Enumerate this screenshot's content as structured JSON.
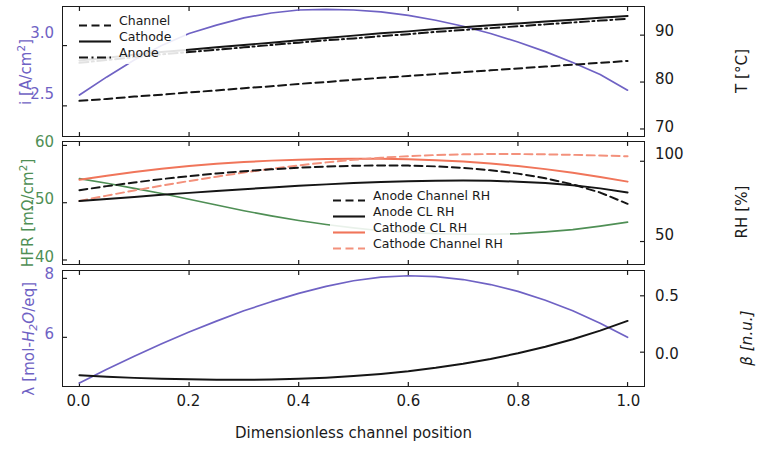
{
  "figure": {
    "xlabel": "Dimensionless channel position",
    "xticks": [
      "0.0",
      "0.2",
      "0.4",
      "0.6",
      "0.8",
      "1.0"
    ],
    "xlim": [
      -0.03,
      1.03
    ],
    "colors": {
      "purple": "#6f62c4",
      "green": "#4f8f55",
      "black": "#151515",
      "salmon": "#f0755a",
      "salmon_light": "#f3917c",
      "axis": "#1a1a1a"
    }
  },
  "panel_top": {
    "left_axis_label": "i [A/cm",
    "left_axis_label_sup": "2",
    "left_axis_label_end": "]",
    "left_ticks": [
      "3.0",
      "2.5"
    ],
    "right_axis_label": "T [°C]",
    "right_ticks": [
      "90",
      "80",
      "70"
    ],
    "legend": [
      {
        "label": "Channel",
        "style": "dashed",
        "color": "#151515"
      },
      {
        "label": "Cathode",
        "style": "solid",
        "color": "#151515"
      },
      {
        "label": "Anode",
        "style": "dashdot",
        "color": "#151515"
      }
    ]
  },
  "panel_mid": {
    "left_axis_label": "HFR [mΩ/cm",
    "left_axis_label_sup": "2",
    "left_axis_label_end": "]",
    "left_ticks": [
      "60",
      "50",
      "40"
    ],
    "right_axis_label": "RH [%]",
    "right_ticks": [
      "100",
      "50"
    ],
    "legend": [
      {
        "label": "Anode Channel RH",
        "style": "dashed",
        "color": "#151515"
      },
      {
        "label": "Anode CL RH",
        "style": "solid",
        "color": "#151515"
      },
      {
        "label": "Cathode CL RH",
        "style": "solid",
        "color": "#f0755a"
      },
      {
        "label": "Cathode Channel RH",
        "style": "dashed",
        "color": "#f3917c"
      }
    ]
  },
  "panel_bot": {
    "left_axis_label_pre": "λ [mol-",
    "left_axis_label_ital": "H",
    "left_axis_label_sub": "2",
    "left_axis_label_ital2": "O",
    "left_axis_label_post": "/eq]",
    "left_ticks": [
      "8",
      "6"
    ],
    "right_axis_label": "β [n.u.]",
    "right_ticks": [
      "0.5",
      "0.0"
    ]
  },
  "chart_data": [
    {
      "type": "line",
      "panel": "top",
      "title": "",
      "xlabel": "",
      "x": [
        0,
        0.05,
        0.1,
        0.15,
        0.2,
        0.25,
        0.3,
        0.35,
        0.4,
        0.45,
        0.5,
        0.55,
        0.6,
        0.65,
        0.7,
        0.75,
        0.8,
        0.85,
        0.9,
        0.95,
        1.0
      ],
      "left": {
        "ylabel": "i [A/cm2]",
        "ylim": [
          2.25,
          3.32
        ],
        "yticks": [
          2.5,
          3.0
        ],
        "grid": false,
        "series": [
          {
            "name": "Current density",
            "color": "#6f62c4",
            "style": "solid",
            "values": [
              2.59,
              2.74,
              2.88,
              3.0,
              3.1,
              3.17,
              3.23,
              3.27,
              3.295,
              3.3,
              3.295,
              3.28,
              3.25,
              3.21,
              3.16,
              3.1,
              3.03,
              2.95,
              2.86,
              2.76,
              2.63
            ]
          }
        ]
      },
      "right": {
        "ylabel": "T [°C]",
        "ylim": [
          68.5,
          96.0
        ],
        "yticks": [
          70,
          80,
          90
        ],
        "grid": false,
        "series": [
          {
            "name": "Cathode",
            "color": "#151515",
            "style": "solid",
            "values": [
              84.6,
              85.2,
              85.8,
              86.4,
              86.9,
              87.4,
              87.9,
              88.4,
              88.9,
              89.4,
              89.9,
              90.4,
              90.8,
              91.3,
              91.7,
              92.1,
              92.5,
              92.9,
              93.3,
              93.7,
              94.1
            ]
          },
          {
            "name": "Anode",
            "color": "#151515",
            "style": "dashdot",
            "values": [
              84.1,
              84.7,
              85.3,
              85.9,
              86.4,
              86.9,
              87.4,
              87.9,
              88.4,
              88.9,
              89.3,
              89.8,
              90.2,
              90.7,
              91.1,
              91.5,
              91.9,
              92.3,
              92.7,
              93.1,
              93.5
            ]
          },
          {
            "name": "Channel",
            "color": "#151515",
            "style": "dashed",
            "values": [
              76.0,
              76.4,
              76.9,
              77.3,
              77.8,
              78.2,
              78.7,
              79.1,
              79.6,
              80.0,
              80.5,
              80.9,
              81.3,
              81.7,
              82.1,
              82.5,
              82.9,
              83.3,
              83.7,
              84.1,
              84.5
            ]
          }
        ]
      }
    },
    {
      "type": "line",
      "panel": "middle",
      "x": [
        0,
        0.05,
        0.1,
        0.15,
        0.2,
        0.25,
        0.3,
        0.35,
        0.4,
        0.45,
        0.5,
        0.55,
        0.6,
        0.65,
        0.7,
        0.75,
        0.8,
        0.85,
        0.9,
        0.95,
        1.0
      ],
      "left": {
        "ylabel": "HFR [mOhm/cm2]",
        "ylim": [
          39.3,
          60.6
        ],
        "yticks": [
          40,
          50,
          60
        ],
        "grid": false,
        "series": [
          {
            "name": "HFR",
            "color": "#4f8f55",
            "style": "solid",
            "values": [
              54.2,
              53.4,
              52.5,
              51.6,
              50.6,
              49.6,
              48.6,
              47.7,
              46.9,
              46.2,
              45.6,
              45.1,
              44.8,
              44.6,
              44.5,
              44.5,
              44.6,
              44.9,
              45.3,
              45.9,
              46.6
            ]
          }
        ]
      },
      "right": {
        "ylabel": "RH [%]",
        "ylim": [
          36.0,
          112.0
        ],
        "yticks": [
          50,
          100
        ],
        "grid": false,
        "series": [
          {
            "name": "Cathode CL RH",
            "color": "#f0755a",
            "style": "solid",
            "values": [
              88.5,
              91.0,
              93.3,
              95.3,
              97.0,
              98.4,
              99.5,
              100.4,
              101.0,
              101.4,
              101.6,
              101.6,
              101.3,
              100.7,
              99.8,
              98.6,
              97.0,
              95.1,
              92.8,
              90.2,
              87.3
            ]
          },
          {
            "name": "Cathode Channel RH",
            "color": "#f3917c",
            "style": "dashed",
            "values": [
              75.3,
              78.6,
              81.8,
              84.8,
              87.7,
              90.4,
              93.0,
              95.3,
              97.4,
              99.3,
              100.9,
              102.2,
              103.2,
              103.9,
              104.3,
              104.5,
              104.5,
              104.3,
              104.0,
              103.6,
              103.1
            ]
          },
          {
            "name": "Anode Channel RH",
            "color": "#151515",
            "style": "dashed",
            "values": [
              82.0,
              84.5,
              86.8,
              88.9,
              90.7,
              92.4,
              93.8,
              95.0,
              96.0,
              96.7,
              97.2,
              97.4,
              97.3,
              96.8,
              95.9,
              94.4,
              92.3,
              89.4,
              85.6,
              80.5,
              73.5
            ]
          },
          {
            "name": "Anode CL RH",
            "color": "#151515",
            "style": "solid",
            "values": [
              75.2,
              76.5,
              77.8,
              79.1,
              80.3,
              81.5,
              82.6,
              83.7,
              84.7,
              85.6,
              86.4,
              87.1,
              87.6,
              87.9,
              88.0,
              87.8,
              87.3,
              86.4,
              85.0,
              83.1,
              80.6
            ]
          }
        ]
      }
    },
    {
      "type": "line",
      "panel": "bottom",
      "x": [
        0,
        0.05,
        0.1,
        0.15,
        0.2,
        0.25,
        0.3,
        0.35,
        0.4,
        0.45,
        0.5,
        0.55,
        0.6,
        0.65,
        0.7,
        0.75,
        0.8,
        0.85,
        0.9,
        0.95,
        1.0
      ],
      "left": {
        "ylabel": "lambda [mol-H2O/eq]",
        "ylim": [
          4.35,
          8.25
        ],
        "yticks": [
          6,
          8
        ],
        "grid": false,
        "series": [
          {
            "name": "Water content lambda",
            "color": "#6f62c4",
            "style": "solid",
            "values": [
              4.45,
              4.92,
              5.36,
              5.78,
              6.18,
              6.55,
              6.9,
              7.21,
              7.49,
              7.73,
              7.92,
              8.04,
              8.09,
              8.06,
              7.96,
              7.79,
              7.56,
              7.26,
              6.9,
              6.48,
              6.0
            ]
          }
        ]
      },
      "right": {
        "ylabel": "beta [n.u.]",
        "ylim": [
          -0.3,
          0.72
        ],
        "yticks": [
          0.0,
          0.5
        ],
        "grid": false,
        "series": [
          {
            "name": "Water transport coefficient beta",
            "color": "#151515",
            "style": "solid",
            "values": [
              -0.205,
              -0.218,
              -0.228,
              -0.236,
              -0.241,
              -0.244,
              -0.245,
              -0.242,
              -0.236,
              -0.226,
              -0.212,
              -0.193,
              -0.169,
              -0.139,
              -0.103,
              -0.06,
              -0.01,
              0.048,
              0.115,
              0.191,
              0.277
            ]
          }
        ]
      }
    }
  ]
}
